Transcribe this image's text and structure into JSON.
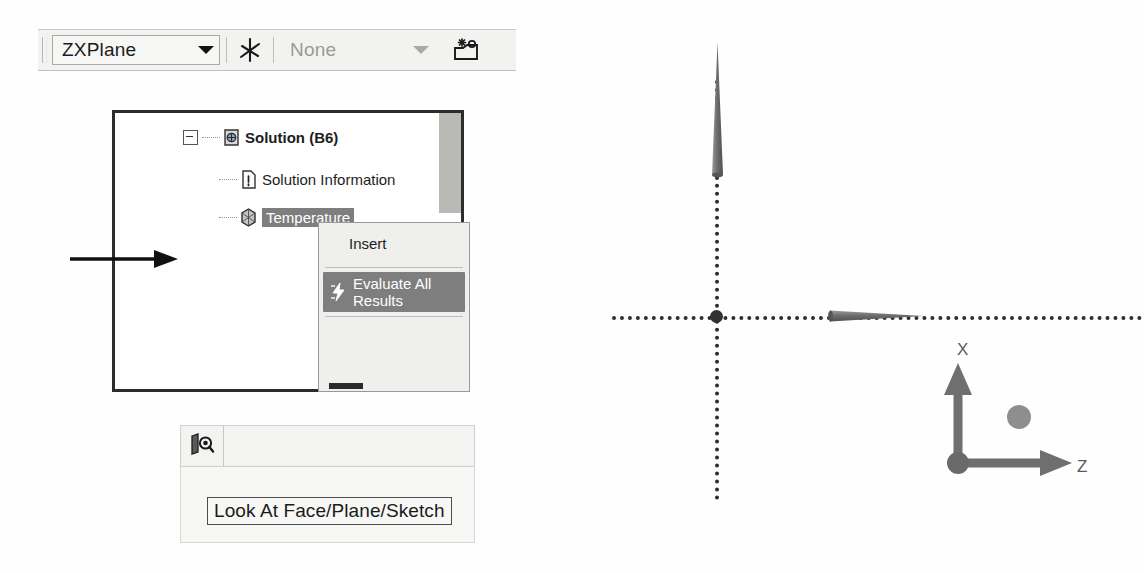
{
  "toolbar": {
    "plane_select": {
      "value": "ZXPlane",
      "icon": "plane-axes-icon",
      "caret": "chevron-down-icon"
    },
    "sketch_select": {
      "value": "None",
      "placeholder": "None",
      "icon": "new-sketch-icon",
      "caret": "chevron-down-icon"
    }
  },
  "tree": {
    "items": [
      {
        "label": "Solution (B6)",
        "icon": "solution-icon",
        "bold": true,
        "selected": false
      },
      {
        "label": "Solution Information",
        "icon": "solution-information-icon",
        "bold": false,
        "selected": false
      },
      {
        "label": "Temperature",
        "icon": "temperature-icon",
        "bold": false,
        "selected": true
      }
    ]
  },
  "context_menu": {
    "items": [
      {
        "label": "Insert",
        "icon": "",
        "highlighted": false
      },
      {
        "label": "Evaluate All Results",
        "icon": "evaluate-results-icon",
        "highlighted": true
      }
    ]
  },
  "lookat": {
    "button_icon": "look-at-face-plane-sketch-icon",
    "tooltip": "Look At Face/Plane/Sketch"
  },
  "viewport": {
    "axis_labels": {
      "x": "X",
      "z": "Z"
    },
    "origin_marker": "origin-point",
    "triad": {
      "up_axis": "X",
      "right_axis": "Z",
      "out_axis_marker": "y-axis-sphere"
    }
  },
  "colors": {
    "selection": "#7e7e7e",
    "toolbar_bg": "#f2f2f0",
    "panel_border": "#2c2c2c",
    "axis": "#2d2d2d",
    "triad": "#6f6f6f",
    "label_text": "#5a5a5a"
  }
}
